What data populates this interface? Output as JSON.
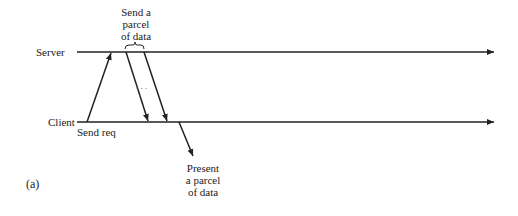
{
  "diagram": {
    "panel_label": "(a)",
    "timelines": [
      {
        "name": "Server",
        "y": 52
      },
      {
        "name": "Client",
        "y": 122
      }
    ],
    "annotations": {
      "send_parcel": [
        "Send a",
        "parcel",
        "of data"
      ],
      "send_req": "Send req",
      "present_parcel": [
        "Present",
        "a parcel",
        "of data"
      ],
      "ellipsis": ". . ."
    },
    "arrows": [
      {
        "name": "request",
        "from": [
          87,
          122
        ],
        "to": [
          111,
          52
        ]
      },
      {
        "name": "data-1",
        "from": [
          126,
          52
        ],
        "to": [
          148,
          122
        ]
      },
      {
        "name": "data-2",
        "from": [
          144,
          52
        ],
        "to": [
          167,
          122
        ]
      },
      {
        "name": "present",
        "from": [
          179,
          122
        ],
        "to": [
          193,
          155
        ]
      }
    ],
    "colors": {
      "line": "#222222",
      "background": "#ffffff"
    }
  }
}
